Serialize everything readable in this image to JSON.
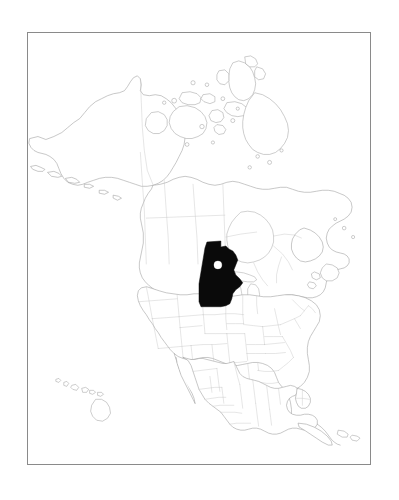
{
  "figure": {
    "kind": "locator-map",
    "caption": "",
    "background_color": "#ffffff"
  },
  "frame": {
    "name": "map-border",
    "stroke_color": "#8a8a8a",
    "x": 27,
    "y": 32,
    "width": 344,
    "height": 433
  },
  "map": {
    "projection_region": "North America",
    "coastline_color": "#9a9a9a",
    "subdivision_border_color": "#c2c2c2",
    "land_fill_color": "#ffffff",
    "water_fill_color": "#ffffff"
  },
  "highlight": {
    "name": "Minnesota",
    "fill_color": "#0a0a0a",
    "marker": {
      "name": "location-marker",
      "shape": "circle",
      "fill_color": "#ffffff",
      "radius_px": 4
    }
  },
  "regions": [
    {
      "name": "Alaska",
      "type": "state"
    },
    {
      "name": "Hawaii",
      "type": "state"
    },
    {
      "name": "Canada",
      "type": "country"
    },
    {
      "name": "United States",
      "type": "country"
    },
    {
      "name": "Mexico",
      "type": "country"
    },
    {
      "name": "Greenland",
      "type": "territory"
    },
    {
      "name": "Cuba",
      "type": "country"
    }
  ],
  "features": [
    {
      "name": "Canadian Arctic Archipelago",
      "type": "islands"
    },
    {
      "name": "Baffin Island",
      "type": "island"
    },
    {
      "name": "Victoria Island",
      "type": "island"
    },
    {
      "name": "Ellesmere Island",
      "type": "island"
    },
    {
      "name": "Hudson Bay",
      "type": "bay"
    },
    {
      "name": "Great Lakes",
      "type": "lakes"
    },
    {
      "name": "Newfoundland",
      "type": "island"
    },
    {
      "name": "Yucatan Peninsula",
      "type": "peninsula"
    },
    {
      "name": "Florida Peninsula",
      "type": "peninsula"
    },
    {
      "name": "Aleutian Islands",
      "type": "islands"
    },
    {
      "name": "Baja California",
      "type": "peninsula"
    },
    {
      "name": "Hawaiian Islands",
      "type": "islands"
    }
  ],
  "chart_data": {
    "type": "map",
    "xlabel": "",
    "ylabel": "",
    "highlighted": [
      "Minnesota"
    ],
    "highlight_fill": "#0a0a0a",
    "marker_points": [
      {
        "label": "Minnesota",
        "fill": "#ffffff",
        "radius": 4
      }
    ],
    "legend": [],
    "grid": false
  }
}
